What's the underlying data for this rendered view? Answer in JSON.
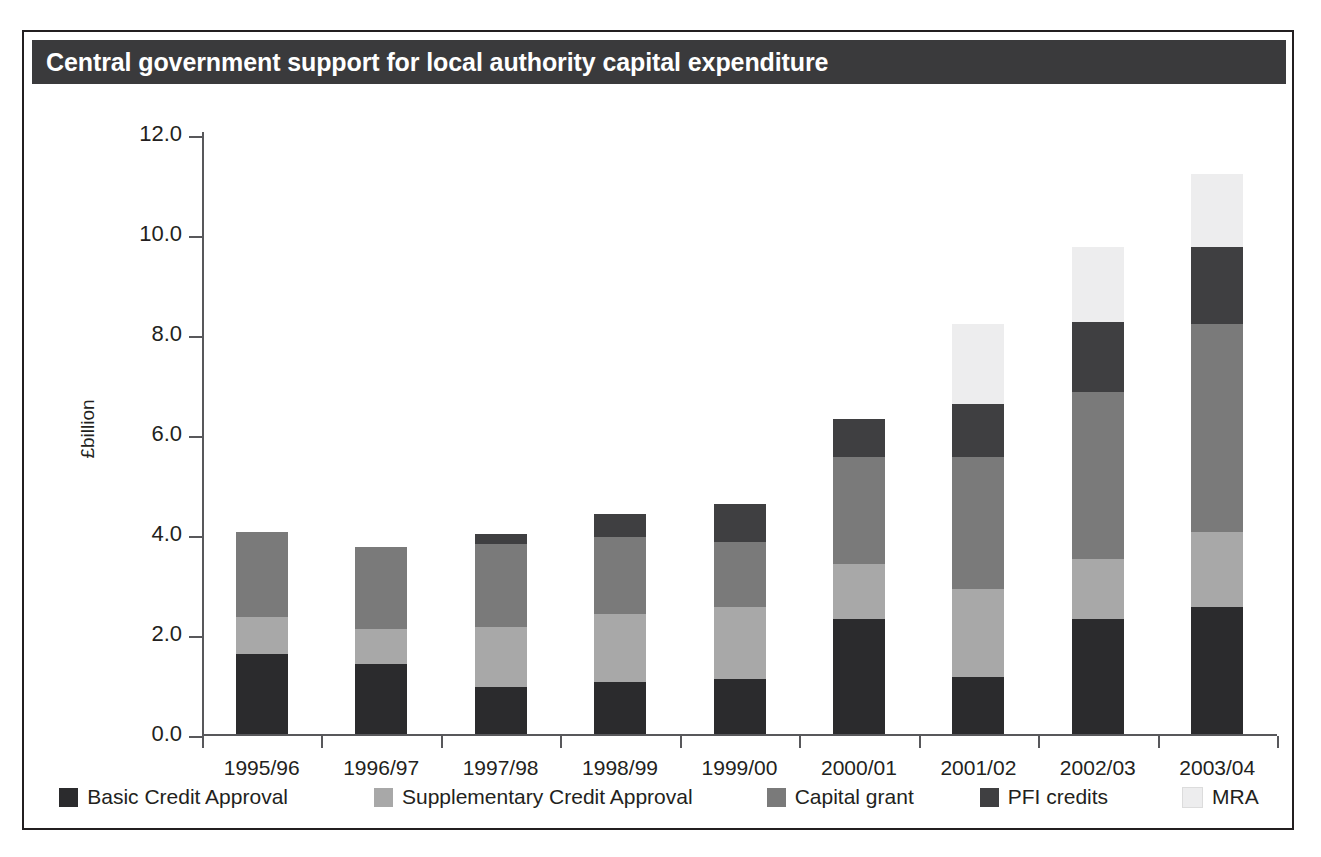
{
  "figure": {
    "title": "Central government support for local authority capital expenditure",
    "title_bar_color": "#3a3a3c",
    "frame_color": "#231f20",
    "background": "#ffffff"
  },
  "chart_data": {
    "type": "bar",
    "stacked": true,
    "title": "Central government support for local authority capital expenditure",
    "xlabel": "",
    "ylabel": "£billion",
    "ylim": [
      0.0,
      12.0
    ],
    "ytick_step": 2.0,
    "grid": false,
    "legend_position": "bottom",
    "categories": [
      "1995/96",
      "1996/97",
      "1997/98",
      "1998/99",
      "1999/00",
      "2000/01",
      "2001/02",
      "2002/03",
      "2003/04"
    ],
    "ytick_labels": [
      "12.0",
      "10.0",
      "8.0",
      "6.0",
      "4.0",
      "2.0",
      "0.0"
    ],
    "ytick_values": [
      12.0,
      10.0,
      8.0,
      6.0,
      4.0,
      2.0,
      0.0
    ],
    "series": [
      {
        "name": "Basic Credit Approval",
        "color": "#2b2b2d",
        "values": [
          1.6,
          1.4,
          0.95,
          1.05,
          1.1,
          2.3,
          1.15,
          2.3,
          2.55
        ]
      },
      {
        "name": "Supplementary Credit Approval",
        "color": "#a8a8a8",
        "values": [
          0.75,
          0.7,
          1.2,
          1.35,
          1.45,
          1.1,
          1.75,
          1.2,
          1.5
        ]
      },
      {
        "name": "Capital grant",
        "color": "#7a7a7a",
        "values": [
          1.7,
          1.65,
          1.65,
          1.55,
          1.3,
          2.15,
          2.65,
          3.35,
          4.15
        ]
      },
      {
        "name": "PFI credits",
        "color": "#3f3f41",
        "values": [
          0.0,
          0.0,
          0.2,
          0.45,
          0.75,
          0.75,
          1.05,
          1.4,
          1.55
        ]
      },
      {
        "name": "MRA",
        "color": "#ededee",
        "values": [
          0.0,
          0.0,
          0.0,
          0.0,
          0.0,
          0.0,
          1.6,
          1.5,
          1.45
        ]
      }
    ],
    "totals": [
      4.05,
      3.75,
      4.0,
      4.4,
      4.6,
      6.3,
      8.2,
      9.75,
      11.2
    ]
  }
}
